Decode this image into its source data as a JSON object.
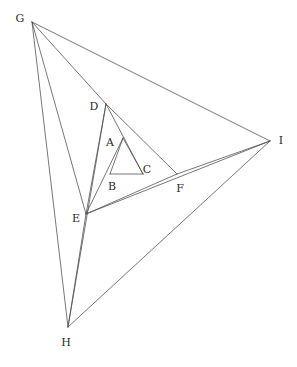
{
  "figure": {
    "background_color": "#ffffff",
    "stroke_color": "#4a4a4a",
    "label_color": "#2b2b2b",
    "stroke_width": 0.75,
    "canvas": {
      "width": 297,
      "height": 367
    }
  },
  "chart_data": {
    "type": "diagram",
    "points": [
      {
        "name": "A",
        "x": 123,
        "y": 138,
        "label": "A",
        "label_x": 110,
        "label_y": 143
      },
      {
        "name": "B",
        "x": 110,
        "y": 174,
        "label": "B",
        "label_x": 112,
        "label_y": 187
      },
      {
        "name": "C",
        "x": 143,
        "y": 174,
        "label": "C",
        "label_x": 147,
        "label_y": 170
      },
      {
        "name": "D",
        "x": 106,
        "y": 104,
        "label": "D",
        "label_x": 94,
        "label_y": 107
      },
      {
        "name": "E",
        "x": 86,
        "y": 214,
        "label": "E",
        "label_x": 76,
        "label_y": 219
      },
      {
        "name": "F",
        "x": 177,
        "y": 174,
        "label": "F",
        "label_x": 180,
        "label_y": 189
      },
      {
        "name": "G",
        "x": 32,
        "y": 22,
        "label": "G",
        "label_x": 20,
        "label_y": 19
      },
      {
        "name": "H",
        "x": 68,
        "y": 327,
        "label": "H",
        "label_x": 66,
        "label_y": 343
      },
      {
        "name": "I",
        "x": 270,
        "y": 141,
        "label": "I",
        "label_x": 281,
        "label_y": 141
      }
    ],
    "edges": [
      {
        "name": "AB",
        "from": "A",
        "to": "B"
      },
      {
        "name": "AC",
        "from": "A",
        "to": "C"
      },
      {
        "name": "BC",
        "from": "B",
        "to": "C"
      },
      {
        "name": "DE",
        "from": "D",
        "to": "E"
      },
      {
        "name": "EF",
        "from": "E",
        "to": "F"
      },
      {
        "name": "DF",
        "from": "D",
        "to": "F"
      },
      {
        "name": "GH",
        "from": "G",
        "to": "H"
      },
      {
        "name": "HI",
        "from": "H",
        "to": "I"
      },
      {
        "name": "GI",
        "from": "G",
        "to": "I"
      },
      {
        "name": "EA",
        "from": "E",
        "to": "A"
      },
      {
        "name": "DC",
        "from": "D",
        "to": "C"
      },
      {
        "name": "GE",
        "from": "G",
        "to": "E"
      },
      {
        "name": "GD",
        "from": "G",
        "to": "D"
      },
      {
        "name": "HD",
        "from": "H",
        "to": "D"
      },
      {
        "name": "HE",
        "from": "H",
        "to": "E"
      },
      {
        "name": "IE",
        "from": "I",
        "to": "E"
      },
      {
        "name": "IF",
        "from": "I",
        "to": "F"
      }
    ],
    "triangles": [
      {
        "name": "inner",
        "vertices": [
          "A",
          "B",
          "C"
        ]
      },
      {
        "name": "middle",
        "vertices": [
          "D",
          "E",
          "F"
        ]
      },
      {
        "name": "outer",
        "vertices": [
          "G",
          "H",
          "I"
        ]
      }
    ]
  }
}
